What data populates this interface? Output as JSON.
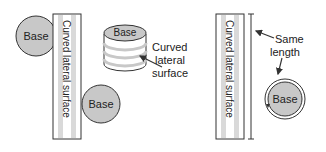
{
  "left_net": {
    "strip_label": "Curved lateral surface",
    "top_base_label": "Base",
    "bottom_base_label": "Base"
  },
  "cylinder": {
    "base_label": "Base",
    "annotation_lines": [
      "Curved",
      "lateral",
      "surface"
    ]
  },
  "right_net": {
    "strip_label": "Curved lateral surface",
    "annotation_lines": [
      "Same",
      "length"
    ],
    "base_label": "Base"
  },
  "colors": {
    "base_fill": "#c8c8c8",
    "stripe_fill": "#d9d9d9",
    "outline": "#333333"
  }
}
